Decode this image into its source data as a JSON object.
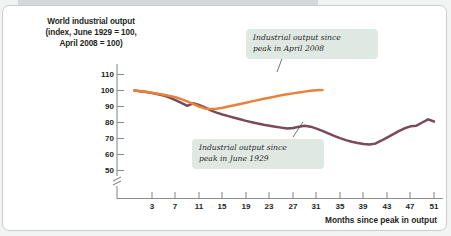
{
  "chart_data": {
    "type": "line",
    "title": "World industrial output (index, June 1929 = 100, April 2008 = 100)",
    "title_line1": "World industrial output",
    "title_line2": "(index, June 1929 = 100,",
    "title_line3": "April 2008 = 100)",
    "xlabel": "Months since peak in output",
    "ylabel": "",
    "xlim": [
      0,
      53
    ],
    "ylim": [
      45,
      112
    ],
    "ylim_break": true,
    "yticks": [
      50,
      60,
      70,
      80,
      90,
      100,
      110
    ],
    "xticks": [
      3,
      7,
      11,
      15,
      19,
      23,
      27,
      31,
      35,
      39,
      43,
      47,
      51
    ],
    "grid": false,
    "legend": "annotations",
    "series": [
      {
        "name": "Industrial output since peak in April 2008",
        "color": "#e8823a",
        "x": [
          0,
          1,
          2,
          3,
          4,
          5,
          6,
          7,
          8,
          9,
          10,
          11,
          12,
          13,
          14,
          15,
          16,
          17,
          18,
          19,
          20,
          21,
          22,
          23,
          24,
          25,
          26,
          27,
          28,
          29,
          30,
          31,
          32
        ],
        "y": [
          100,
          99.6,
          99.2,
          98.6,
          98.0,
          97.4,
          96.6,
          95.8,
          94.6,
          93.2,
          91.6,
          90.0,
          88.8,
          88.4,
          88.6,
          89.2,
          90.0,
          90.8,
          91.6,
          92.4,
          93.2,
          94.0,
          94.8,
          95.5,
          96.2,
          97.0,
          97.6,
          98.2,
          98.8,
          99.3,
          99.8,
          100.2,
          100.3
        ]
      },
      {
        "name": "Industrial output since peak in June 1929",
        "color": "#7b4a5a",
        "x": [
          0,
          1,
          2,
          3,
          4,
          5,
          6,
          7,
          8,
          9,
          10,
          11,
          12,
          13,
          14,
          15,
          16,
          17,
          18,
          19,
          20,
          21,
          22,
          23,
          24,
          25,
          26,
          27,
          28,
          29,
          30,
          31,
          32,
          33,
          34,
          35,
          36,
          37,
          38,
          39,
          40,
          41,
          42,
          43,
          44,
          45,
          46,
          47,
          48,
          49,
          50,
          51
        ],
        "y": [
          100,
          99.5,
          99.0,
          98.4,
          97.6,
          96.8,
          95.6,
          94.0,
          92.2,
          90.4,
          92.0,
          91.0,
          89.4,
          87.6,
          86.2,
          85.0,
          84.0,
          83.0,
          82.0,
          81.0,
          80.2,
          79.4,
          78.6,
          78.0,
          77.4,
          76.8,
          76.2,
          76.6,
          77.4,
          78.0,
          77.4,
          76.2,
          74.8,
          73.2,
          71.6,
          70.2,
          69.0,
          68.0,
          67.2,
          66.6,
          66.2,
          66.8,
          68.6,
          70.6,
          72.6,
          74.6,
          76.4,
          77.6,
          78.0,
          80.0,
          82.0,
          80.6
        ]
      }
    ],
    "annotations": [
      {
        "id": "note-2008",
        "line1": "Industrial output since",
        "line2": "peak in April 2008"
      },
      {
        "id": "note-1929",
        "line1": "Industrial output since",
        "line2": "peak in June 1929"
      }
    ]
  }
}
